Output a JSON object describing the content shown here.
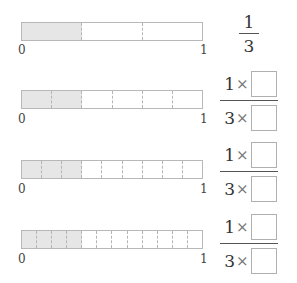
{
  "diagram": {
    "rows": [
      {
        "segments": 3,
        "shaded": 1,
        "label_start": "0",
        "label_end": "1",
        "fraction": {
          "type": "simple",
          "numerator": "1",
          "denominator": "3"
        }
      },
      {
        "segments": 6,
        "shaded": 2,
        "label_start": "0",
        "label_end": "1",
        "fraction": {
          "type": "blank",
          "numerator": "1",
          "denominator": "3",
          "times": "×",
          "numerator_box": "",
          "denominator_box": ""
        }
      },
      {
        "segments": 9,
        "shaded": 3,
        "label_start": "0",
        "label_end": "1",
        "fraction": {
          "type": "blank",
          "numerator": "1",
          "denominator": "3",
          "times": "×",
          "numerator_box": "",
          "denominator_box": ""
        }
      },
      {
        "segments": 12,
        "shaded": 4,
        "label_start": "0",
        "label_end": "1",
        "fraction": {
          "type": "blank",
          "numerator": "1",
          "denominator": "3",
          "times": "×",
          "numerator_box": "",
          "denominator_box": ""
        }
      }
    ],
    "colors": {
      "shaded": "#e6e6e6",
      "border": "#b8b8b8",
      "divider": "#b5b5b5",
      "text": "#333333"
    }
  }
}
